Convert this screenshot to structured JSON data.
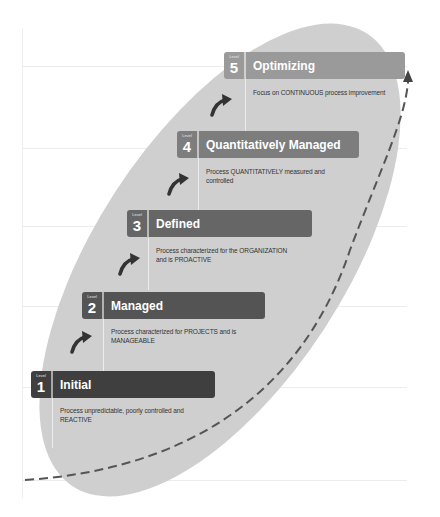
{
  "diagram": {
    "type": "maturity-staircase",
    "level_label": "Level",
    "colors": {
      "ellipse": "#cfcfcf",
      "arrow": "#555555",
      "level_bars": [
        "#3f3f3f",
        "#545454",
        "#666666",
        "#7d7d7d",
        "#9a9a9a"
      ]
    },
    "levels": [
      {
        "number": "1",
        "title": "Initial",
        "description": "Process unpredictable, poorly controlled and REACTIVE"
      },
      {
        "number": "2",
        "title": "Managed",
        "description": "Process characterized for PROJECTS and is MANAGEABLE"
      },
      {
        "number": "3",
        "title": "Defined",
        "description": "Process characterized for the ORGANIZATION and is PROACTIVE"
      },
      {
        "number": "4",
        "title": "Quantitatively Managed",
        "description": "Process QUANTITATIVELY measured and controlled"
      },
      {
        "number": "5",
        "title": "Optimizing",
        "description": "Focus on CONTINUOUS process improvement"
      }
    ]
  }
}
